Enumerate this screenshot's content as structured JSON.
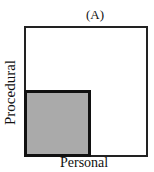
{
  "diagram": {
    "title": "(A)",
    "y_axis_label": "Procedural",
    "x_axis_label": "Personal",
    "regions": [
      {
        "name": "outer-square",
        "fill": "#ffffff",
        "border": "#222222"
      },
      {
        "name": "shaded-square",
        "fill": "#c8c8c8",
        "pattern": "stipple",
        "border": "#111111"
      }
    ]
  }
}
